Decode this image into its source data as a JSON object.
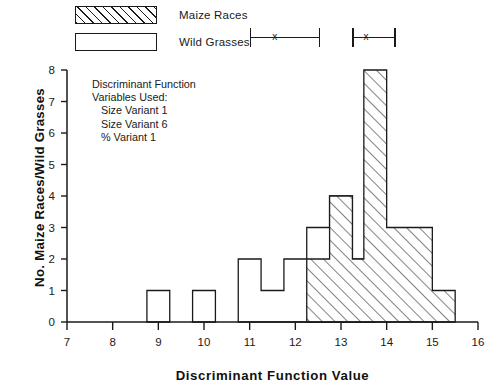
{
  "legend": {
    "items": [
      {
        "label": "Maize Races",
        "swatch": "hatched-rectangle"
      },
      {
        "label": "Wild Grasses",
        "swatch": "open-rectangle"
      }
    ]
  },
  "range_markers": [
    {
      "name": "wild-grasses-range",
      "group": "Wild Grasses",
      "low": 11.0,
      "mean": 11.55,
      "high": 12.55,
      "mean_glyph": "x"
    },
    {
      "name": "maize-races-range",
      "group": "Maize Races",
      "low": 13.25,
      "mean": 13.55,
      "high": 14.2,
      "mean_glyph": "x"
    }
  ],
  "annotation": {
    "line1": "Discriminant Function",
    "line2": "Variables Used:",
    "line3": "Size Variant 1",
    "line4": "Size Variant 6",
    "line5": "% Variant 1"
  },
  "axes": {
    "x_title": "Discriminant Function Value",
    "y_title": "No. Maize Races/Wild Grasses",
    "x_ticks": [
      "7",
      "8",
      "9",
      "10",
      "11",
      "12",
      "13",
      "14",
      "15",
      "16"
    ],
    "y_ticks": [
      "0",
      "1",
      "2",
      "3",
      "4",
      "5",
      "6",
      "7",
      "8"
    ]
  },
  "chart_data": {
    "type": "bar",
    "title": "",
    "subtitle": "",
    "xlabel": "Discriminant Function Value",
    "ylabel": "No. Maize Races/Wild Grasses",
    "xlim": [
      7,
      16
    ],
    "ylim": [
      0,
      8
    ],
    "grid": false,
    "legend_position": "top-left",
    "bin_width": 0.5,
    "orientation": "overlaid-histogram",
    "series": [
      {
        "name": "Wild Grasses",
        "style": "open",
        "bins": [
          {
            "x0": 8.75,
            "x1": 9.25,
            "value": 1
          },
          {
            "x0": 9.75,
            "x1": 10.25,
            "value": 1
          },
          {
            "x0": 10.75,
            "x1": 11.25,
            "value": 2
          },
          {
            "x0": 11.25,
            "x1": 11.75,
            "value": 1
          },
          {
            "x0": 11.75,
            "x1": 12.25,
            "value": 2
          },
          {
            "x0": 12.25,
            "x1": 12.75,
            "value": 3
          },
          {
            "x0": 12.75,
            "x1": 13.25,
            "value": 4
          },
          {
            "x0": 13.25,
            "x1": 13.75,
            "value": 2
          }
        ]
      },
      {
        "name": "Maize Races",
        "style": "hatched",
        "bins": [
          {
            "x0": 12.25,
            "x1": 12.75,
            "value": 2
          },
          {
            "x0": 12.75,
            "x1": 13.25,
            "value": 4
          },
          {
            "x0": 13.25,
            "x1": 13.5,
            "value": 2
          },
          {
            "x0": 13.5,
            "x1": 14.0,
            "value": 8
          },
          {
            "x0": 14.0,
            "x1": 14.5,
            "value": 3
          },
          {
            "x0": 14.5,
            "x1": 15.0,
            "value": 3
          },
          {
            "x0": 15.0,
            "x1": 15.5,
            "value": 1
          }
        ]
      }
    ]
  },
  "colors": {
    "ink": "#1a1a1a",
    "background": "#ffffff"
  }
}
